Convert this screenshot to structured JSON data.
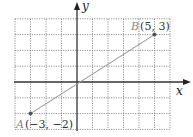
{
  "chart_data": {
    "type": "scatter",
    "title": "",
    "xlabel": "x",
    "ylabel": "y",
    "xlim": [
      -4,
      6
    ],
    "ylim": [
      -3,
      4
    ],
    "grid": true,
    "grid_style": "dotted",
    "series": [
      {
        "name": "segment AB",
        "points": [
          {
            "label": "A",
            "coord_text": "(−3, −2)",
            "x": -3,
            "y": -2
          },
          {
            "label": "B",
            "coord_text": "(5, 3)",
            "x": 5,
            "y": 3
          }
        ]
      }
    ],
    "colors": {
      "axes": "#333333",
      "grid": "#777777",
      "segment": "#999999",
      "point": "#555555"
    }
  },
  "labels": {
    "x_axis": "x",
    "y_axis": "y",
    "point_a_name": "A",
    "point_a_coords": "(−3, −2)",
    "point_b_name": "B",
    "point_b_coords": "(5, 3)"
  }
}
